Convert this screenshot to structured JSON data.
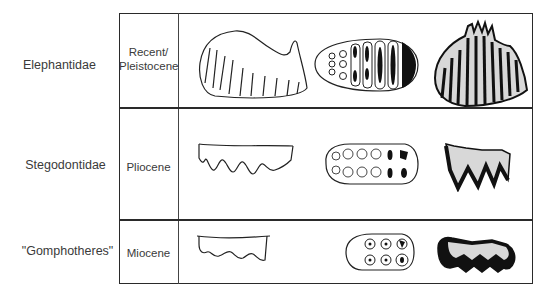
{
  "rows": [
    {
      "family": "Elephantidae",
      "epoch_line1": "Recent/",
      "epoch_line2": "Pleistocene",
      "drawings": [
        "lateral-view-high-crowned-molar",
        "occlusal-view-lamellar-molar",
        "section-view-hypsodont-lamellae"
      ]
    },
    {
      "family": "Stegodontidae",
      "epoch_line1": "Pliocene",
      "drawings": [
        "lateral-view-ridged-molar",
        "occlusal-view-ridged-molar",
        "section-view-ridged-molar"
      ]
    },
    {
      "family": "\"Gomphotheres\"",
      "epoch_line1": "Miocene",
      "drawings": [
        "lateral-view-bunodont-molar",
        "occlusal-view-bunodont-molar",
        "section-view-bunodont-molar"
      ]
    }
  ],
  "colors": {
    "line": "#2a2a2a",
    "text": "#3a3a3a",
    "fill_dark": "#111111",
    "stipple": "#d9d9d9"
  }
}
